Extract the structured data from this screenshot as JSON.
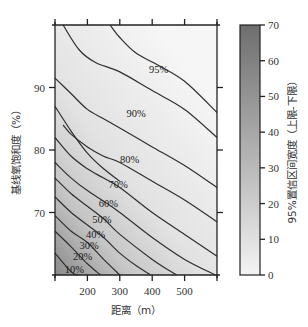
{
  "chart_data": {
    "type": "contour",
    "title": "",
    "xlabel": "距离（m）",
    "ylabel": "基线氧饱和度（%）",
    "colorbar_label": "95%置信区间宽度（上限-下限）",
    "xlim": [
      100,
      600
    ],
    "ylim": [
      60,
      100
    ],
    "x_ticks": [
      100,
      200,
      300,
      400,
      500,
      600
    ],
    "x_tick_labels": [
      "",
      "200",
      "300",
      "400",
      "500",
      ""
    ],
    "y_ticks": [
      70,
      80,
      90
    ],
    "y_tick_labels": [
      "70",
      "80",
      "90"
    ],
    "colorbar_ticks": [
      0,
      10,
      20,
      30,
      40,
      50,
      60,
      70
    ],
    "colorbar_range": [
      0,
      70
    ],
    "colorbar_colors": {
      "low": "#f4f4f4",
      "high": "#6e6e6e"
    },
    "grid": false,
    "contour_levels": [
      {
        "label": "10%",
        "label_pos": [
          160,
          61
        ],
        "points": [
          [
            100,
            63.5
          ],
          [
            150,
            60.5
          ],
          [
            170,
            60
          ]
        ]
      },
      {
        "label": "20%",
        "label_pos": [
          185,
          63
        ],
        "points": [
          [
            100,
            67
          ],
          [
            150,
            64.5
          ],
          [
            200,
            61.8
          ],
          [
            240,
            60
          ]
        ]
      },
      {
        "label": "30%",
        "label_pos": [
          205,
          64.8
        ],
        "points": [
          [
            100,
            69.5
          ],
          [
            150,
            67
          ],
          [
            200,
            65.2
          ],
          [
            250,
            62.5
          ],
          [
            300,
            60
          ]
        ]
      },
      {
        "label": "40%",
        "label_pos": [
          225,
          66.5
        ],
        "points": [
          [
            100,
            72.5
          ],
          [
            150,
            70
          ],
          [
            200,
            68
          ],
          [
            250,
            66
          ],
          [
            300,
            63.5
          ],
          [
            350,
            61.5
          ],
          [
            395,
            60
          ]
        ]
      },
      {
        "label": "50%",
        "label_pos": [
          245,
          69
        ],
        "points": [
          [
            100,
            75.5
          ],
          [
            150,
            73
          ],
          [
            200,
            71
          ],
          [
            250,
            69
          ],
          [
            300,
            66.5
          ],
          [
            400,
            62.5
          ],
          [
            475,
            60
          ]
        ]
      },
      {
        "label": "60%",
        "label_pos": [
          265,
          71.5
        ],
        "points": [
          [
            100,
            78
          ],
          [
            150,
            75.5
          ],
          [
            200,
            73.5
          ],
          [
            250,
            71.8
          ],
          [
            300,
            70
          ],
          [
            400,
            66
          ],
          [
            500,
            62.5
          ],
          [
            595,
            60
          ]
        ]
      },
      {
        "label": "70%",
        "label_pos": [
          295,
          74.5
        ],
        "points": [
          [
            100,
            82
          ],
          [
            150,
            79
          ],
          [
            200,
            77
          ],
          [
            250,
            75.5
          ],
          [
            300,
            74
          ],
          [
            400,
            70
          ],
          [
            500,
            66.5
          ],
          [
            600,
            63
          ]
        ]
      },
      {
        "label": "80%",
        "label_pos": [
          330,
          78.5
        ],
        "points": [
          [
            125,
            84
          ],
          [
            150,
            82.5
          ],
          [
            200,
            80.5
          ],
          [
            250,
            79
          ],
          [
            300,
            78
          ],
          [
            400,
            75
          ],
          [
            500,
            72
          ],
          [
            600,
            68.5
          ]
        ]
      },
      {
        "label": "90%",
        "label_pos": [
          350,
          86
        ],
        "points": [
          [
            100,
            91.5
          ],
          [
            150,
            89
          ],
          [
            200,
            86.5
          ],
          [
            250,
            85
          ],
          [
            300,
            83.5
          ],
          [
            400,
            80.5
          ],
          [
            500,
            77.5
          ],
          [
            600,
            74
          ]
        ]
      },
      {
        "label": "95%",
        "label_pos": [
          420,
          93
        ],
        "points": [
          [
            125,
            100
          ],
          [
            175,
            96
          ],
          [
            225,
            94
          ],
          [
            300,
            92.5
          ],
          [
            400,
            89.5
          ],
          [
            500,
            86.5
          ],
          [
            600,
            82
          ]
        ]
      },
      {
        "label": "",
        "label_pos": null,
        "points": [
          [
            100,
            87
          ],
          [
            150,
            83
          ],
          [
            200,
            79.5
          ],
          [
            250,
            77
          ],
          [
            300,
            75
          ]
        ]
      },
      {
        "label": "",
        "label_pos": null,
        "points": [
          [
            270,
            100
          ],
          [
            300,
            98
          ],
          [
            350,
            95.5
          ],
          [
            420,
            93.5
          ],
          [
            500,
            91
          ],
          [
            600,
            86
          ]
        ]
      }
    ]
  }
}
